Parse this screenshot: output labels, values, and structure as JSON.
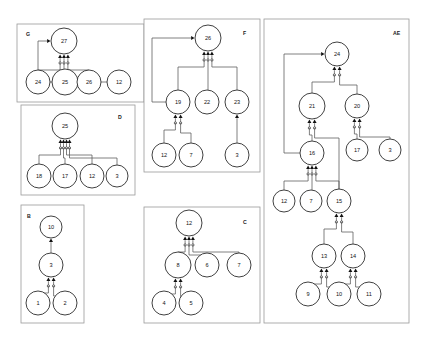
{
  "image": {
    "title": "AND-OR graph panel set",
    "width": 426,
    "height": 341,
    "background_color": "#ffffff"
  },
  "style": {
    "panel_border_color": "#9a9a9a",
    "node_stroke_color": "#2b2b2b",
    "node_fill_color": "#ffffff",
    "edge_color": "#555555",
    "arrow_color": "#111111",
    "text_color": "#141414"
  },
  "panels": [
    {
      "id": "G",
      "label": "G",
      "label_pos": {
        "x": 26,
        "y": 36
      },
      "rect": {
        "x": 17,
        "y": 24,
        "width": 127,
        "height": 78
      },
      "nodes": [
        {
          "id": "g27",
          "text": "27",
          "cx": 64,
          "cy": 41,
          "r": 13
        },
        {
          "id": "g24",
          "text": "24",
          "cx": 38,
          "cy": 82,
          "r": 12
        },
        {
          "id": "g25",
          "text": "25",
          "cx": 65,
          "cy": 82,
          "r": 13
        },
        {
          "id": "g26",
          "text": "26",
          "cx": 89,
          "cy": 82,
          "r": 12
        },
        {
          "id": "g12",
          "text": "12",
          "cx": 119,
          "cy": 82,
          "r": 12
        }
      ],
      "edges": [
        {
          "from": "g24",
          "to": "g27",
          "kind": "and"
        },
        {
          "from": "g25",
          "to": "g27",
          "kind": "and"
        },
        {
          "from": "g26",
          "to": "g27",
          "kind": "and"
        },
        {
          "from": "g12",
          "to": "g27",
          "kind": "or"
        }
      ]
    },
    {
      "id": "D",
      "label": "D",
      "label_pos": {
        "x": 118,
        "y": 119
      },
      "rect": {
        "x": 21,
        "y": 105,
        "width": 114,
        "height": 90
      },
      "nodes": [
        {
          "id": "d25",
          "text": "25",
          "cx": 65,
          "cy": 126,
          "r": 13
        },
        {
          "id": "d18",
          "text": "18",
          "cx": 39,
          "cy": 176,
          "r": 12
        },
        {
          "id": "d17",
          "text": "17",
          "cx": 65,
          "cy": 176,
          "r": 12
        },
        {
          "id": "d12",
          "text": "12",
          "cx": 92,
          "cy": 176,
          "r": 12
        },
        {
          "id": "d3",
          "text": "3",
          "cx": 117,
          "cy": 176,
          "r": 11
        }
      ],
      "edges": [
        {
          "from": "d18",
          "to": "d25",
          "kind": "and"
        },
        {
          "from": "d17",
          "to": "d25",
          "kind": "and"
        },
        {
          "from": "d12",
          "to": "d25",
          "kind": "and"
        },
        {
          "from": "d3",
          "to": "d25",
          "kind": "and"
        }
      ]
    },
    {
      "id": "B",
      "label": "B",
      "label_pos": {
        "x": 27,
        "y": 218
      },
      "rect": {
        "x": 21,
        "y": 205,
        "width": 63,
        "height": 118
      },
      "nodes": [
        {
          "id": "b10",
          "text": "10",
          "cx": 51,
          "cy": 227,
          "r": 11
        },
        {
          "id": "b3",
          "text": "3",
          "cx": 51,
          "cy": 265,
          "r": 12
        },
        {
          "id": "b1",
          "text": "1",
          "cx": 38,
          "cy": 303,
          "r": 12
        },
        {
          "id": "b2",
          "text": "2",
          "cx": 65,
          "cy": 303,
          "r": 12
        }
      ],
      "edges": [
        {
          "from": "b3",
          "to": "b10",
          "kind": "or"
        },
        {
          "from": "b1",
          "to": "b3",
          "kind": "and"
        },
        {
          "from": "b2",
          "to": "b3",
          "kind": "and"
        }
      ]
    },
    {
      "id": "F",
      "label": "F",
      "label_pos": {
        "x": 243,
        "y": 35
      },
      "rect": {
        "x": 144,
        "y": 19,
        "width": 116,
        "height": 153
      },
      "nodes": [
        {
          "id": "f26",
          "text": "26",
          "cx": 208,
          "cy": 38,
          "r": 13
        },
        {
          "id": "f19",
          "text": "19",
          "cx": 178,
          "cy": 102,
          "r": 12
        },
        {
          "id": "f22",
          "text": "22",
          "cx": 207,
          "cy": 102,
          "r": 12
        },
        {
          "id": "f23",
          "text": "23",
          "cx": 237,
          "cy": 102,
          "r": 12
        },
        {
          "id": "f12",
          "text": "12",
          "cx": 164,
          "cy": 155,
          "r": 12
        },
        {
          "id": "f7",
          "text": "7",
          "cx": 191,
          "cy": 155,
          "r": 12
        },
        {
          "id": "f3",
          "text": "3",
          "cx": 237,
          "cy": 155,
          "r": 12
        }
      ],
      "edges": [
        {
          "from": "f19",
          "to": "f26",
          "kind": "or"
        },
        {
          "from": "f19",
          "to": "f26",
          "kind": "and"
        },
        {
          "from": "f22",
          "to": "f26",
          "kind": "and"
        },
        {
          "from": "f23",
          "to": "f26",
          "kind": "and"
        },
        {
          "from": "f12",
          "to": "f19",
          "kind": "and"
        },
        {
          "from": "f7",
          "to": "f19",
          "kind": "and"
        },
        {
          "from": "f3",
          "to": "f23",
          "kind": "or"
        }
      ]
    },
    {
      "id": "C",
      "label": "C",
      "label_pos": {
        "x": 243,
        "y": 224
      },
      "rect": {
        "x": 144,
        "y": 207,
        "width": 116,
        "height": 116
      },
      "nodes": [
        {
          "id": "c12",
          "text": "12",
          "cx": 189,
          "cy": 223,
          "r": 13
        },
        {
          "id": "c8",
          "text": "8",
          "cx": 178,
          "cy": 265,
          "r": 13
        },
        {
          "id": "c6",
          "text": "6",
          "cx": 207,
          "cy": 265,
          "r": 12
        },
        {
          "id": "c7",
          "text": "7",
          "cx": 239,
          "cy": 265,
          "r": 12
        },
        {
          "id": "c4",
          "text": "4",
          "cx": 164,
          "cy": 303,
          "r": 12
        },
        {
          "id": "c5",
          "text": "5",
          "cx": 191,
          "cy": 303,
          "r": 12
        }
      ],
      "edges": [
        {
          "from": "c8",
          "to": "c12",
          "kind": "and"
        },
        {
          "from": "c6",
          "to": "c12",
          "kind": "and"
        },
        {
          "from": "c7",
          "to": "c12",
          "kind": "and"
        },
        {
          "from": "c4",
          "to": "c8",
          "kind": "and"
        },
        {
          "from": "c5",
          "to": "c8",
          "kind": "and"
        }
      ]
    },
    {
      "id": "AE",
      "label": "AE",
      "label_pos": {
        "x": 393,
        "y": 35
      },
      "rect": {
        "x": 264,
        "y": 19,
        "width": 145,
        "height": 304
      },
      "nodes": [
        {
          "id": "ae24",
          "text": "24",
          "cx": 337,
          "cy": 54,
          "r": 12
        },
        {
          "id": "ae21",
          "text": "21",
          "cx": 312,
          "cy": 106,
          "r": 13
        },
        {
          "id": "ae20",
          "text": "20",
          "cx": 357,
          "cy": 106,
          "r": 12
        },
        {
          "id": "ae17",
          "text": "17",
          "cx": 357,
          "cy": 150,
          "r": 11
        },
        {
          "id": "ae3",
          "text": "3",
          "cx": 390,
          "cy": 150,
          "r": 11
        },
        {
          "id": "ae16",
          "text": "16",
          "cx": 312,
          "cy": 153,
          "r": 12
        },
        {
          "id": "ae12",
          "text": "12",
          "cx": 284,
          "cy": 201,
          "r": 11
        },
        {
          "id": "ae7",
          "text": "7",
          "cx": 311,
          "cy": 201,
          "r": 11
        },
        {
          "id": "ae15",
          "text": "15",
          "cx": 339,
          "cy": 201,
          "r": 12
        },
        {
          "id": "ae13",
          "text": "13",
          "cx": 324,
          "cy": 256,
          "r": 12
        },
        {
          "id": "ae14",
          "text": "14",
          "cx": 353,
          "cy": 256,
          "r": 12
        },
        {
          "id": "ae9",
          "text": "9",
          "cx": 308,
          "cy": 294,
          "r": 12
        },
        {
          "id": "ae10",
          "text": "10",
          "cx": 339,
          "cy": 294,
          "r": 12
        },
        {
          "id": "ae11",
          "text": "11",
          "cx": 369,
          "cy": 294,
          "r": 12
        }
      ],
      "edges": [
        {
          "from": "ae16",
          "to": "ae24",
          "kind": "or"
        },
        {
          "from": "ae21",
          "to": "ae24",
          "kind": "and"
        },
        {
          "from": "ae20",
          "to": "ae24",
          "kind": "and"
        },
        {
          "from": "ae16",
          "to": "ae21",
          "kind": "and"
        },
        {
          "from": "ae15",
          "to": "ae21",
          "kind": "and"
        },
        {
          "from": "ae17",
          "to": "ae20",
          "kind": "and"
        },
        {
          "from": "ae3",
          "to": "ae20",
          "kind": "and"
        },
        {
          "from": "ae12",
          "to": "ae16",
          "kind": "and"
        },
        {
          "from": "ae7",
          "to": "ae16",
          "kind": "and"
        },
        {
          "from": "ae15",
          "to": "ae16",
          "kind": "and"
        },
        {
          "from": "ae13",
          "to": "ae15",
          "kind": "and"
        },
        {
          "from": "ae14",
          "to": "ae15",
          "kind": "and"
        },
        {
          "from": "ae9",
          "to": "ae13",
          "kind": "and"
        },
        {
          "from": "ae10",
          "to": "ae13",
          "kind": "and"
        },
        {
          "from": "ae10",
          "to": "ae14",
          "kind": "and"
        },
        {
          "from": "ae11",
          "to": "ae14",
          "kind": "and"
        }
      ]
    }
  ]
}
